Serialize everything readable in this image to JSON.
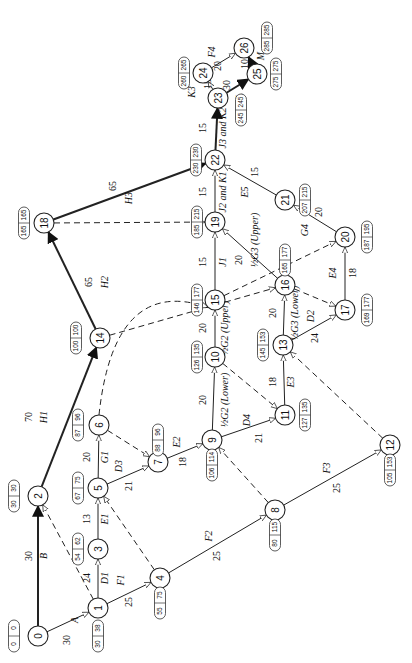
{
  "diagram": {
    "type": "activity-on-arrow network (CPM)",
    "orientation": "rotated 90deg counter-clockwise",
    "nodes": [
      {
        "id": "0",
        "x": 38,
        "y": 636,
        "es": "0",
        "lf": "0",
        "bx": 14,
        "by": 636
      },
      {
        "id": "1",
        "x": 98,
        "y": 608,
        "es": "30",
        "lf": "38",
        "bx": 98,
        "by": 636
      },
      {
        "id": "2",
        "x": 38,
        "y": 496,
        "es": "30",
        "lf": "30",
        "bx": 14,
        "by": 496
      },
      {
        "id": "3",
        "x": 98,
        "y": 549,
        "es": "54",
        "lf": "62",
        "bx": 78,
        "by": 549
      },
      {
        "id": "4",
        "x": 160,
        "y": 578,
        "es": "55",
        "lf": "75",
        "bx": 160,
        "by": 603
      },
      {
        "id": "5",
        "x": 98,
        "y": 488,
        "es": "67",
        "lf": "75",
        "bx": 78,
        "by": 488
      },
      {
        "id": "6",
        "x": 99,
        "y": 425,
        "es": "87",
        "lf": "96",
        "bx": 78,
        "by": 425
      },
      {
        "id": "7",
        "x": 158,
        "y": 462,
        "es": "88",
        "lf": "96",
        "bx": 158,
        "by": 440
      },
      {
        "id": "8",
        "x": 275,
        "y": 510,
        "es": "80",
        "lf": "115",
        "bx": 275,
        "by": 535
      },
      {
        "id": "9",
        "x": 212,
        "y": 440,
        "es": "106",
        "lf": "114",
        "bx": 212,
        "by": 465
      },
      {
        "id": "10",
        "x": 215,
        "y": 357,
        "es": "126",
        "lf": "135",
        "bx": 197,
        "by": 357
      },
      {
        "id": "11",
        "x": 285,
        "y": 415,
        "es": "127",
        "lf": "135",
        "bx": 305,
        "by": 415
      },
      {
        "id": "12",
        "x": 390,
        "y": 445,
        "es": "105",
        "lf": "153",
        "bx": 390,
        "by": 470
      },
      {
        "id": "13",
        "x": 283,
        "y": 345,
        "es": "145",
        "lf": "153",
        "bx": 263,
        "by": 345
      },
      {
        "id": "14",
        "x": 100,
        "y": 338,
        "es": "100",
        "lf": "100",
        "bx": 76,
        "by": 338
      },
      {
        "id": "15",
        "x": 215,
        "y": 300,
        "es": "146",
        "lf": "177",
        "bx": 197,
        "by": 300
      },
      {
        "id": "16",
        "x": 285,
        "y": 285,
        "es": "165",
        "lf": "177",
        "bx": 285,
        "by": 260
      },
      {
        "id": "17",
        "x": 345,
        "y": 310,
        "es": "169",
        "lf": "177",
        "bx": 367,
        "by": 310
      },
      {
        "id": "18",
        "x": 44,
        "y": 223,
        "es": "165",
        "lf": "165",
        "bx": 24,
        "by": 223
      },
      {
        "id": "19",
        "x": 215,
        "y": 222,
        "es": "185",
        "lf": "215",
        "bx": 197,
        "by": 222
      },
      {
        "id": "20",
        "x": 345,
        "y": 237,
        "es": "187",
        "lf": "195",
        "bx": 367,
        "by": 237
      },
      {
        "id": "21",
        "x": 285,
        "y": 200,
        "es": "207",
        "lf": "215",
        "bx": 305,
        "by": 200
      },
      {
        "id": "22",
        "x": 215,
        "y": 160,
        "es": "230",
        "lf": "230",
        "bx": 196,
        "by": 160
      },
      {
        "id": "23",
        "x": 218,
        "y": 98,
        "es": "245",
        "lf": "245",
        "bx": 241,
        "by": 110
      },
      {
        "id": "24",
        "x": 203,
        "y": 73,
        "es": "260",
        "lf": "265",
        "bx": 184,
        "by": 73
      },
      {
        "id": "25",
        "x": 257,
        "y": 74,
        "es": "275",
        "lf": "275",
        "bx": 276,
        "by": 74
      },
      {
        "id": "26",
        "x": 244,
        "y": 48,
        "es": "285",
        "lf": "285",
        "bx": 267,
        "by": 38
      }
    ],
    "edges": [
      {
        "from": "0",
        "to": "1",
        "name": "A",
        "dur": "30",
        "kind": "normal",
        "nx": 78,
        "ny": 620,
        "dx": 70,
        "dy": 640
      },
      {
        "from": "0",
        "to": "2",
        "name": "B",
        "dur": "30",
        "kind": "critical",
        "nx": 47,
        "ny": 556,
        "dx": 32,
        "dy": 556
      },
      {
        "from": "1",
        "to": "2",
        "name": "",
        "dur": "",
        "kind": "dummy"
      },
      {
        "from": "1",
        "to": "3",
        "name": "D1",
        "dur": "24",
        "kind": "normal",
        "nx": 108,
        "ny": 578,
        "dx": 90,
        "dy": 578
      },
      {
        "from": "1",
        "to": "4",
        "name": "F1",
        "dur": "25",
        "kind": "normal",
        "nx": 124,
        "ny": 580,
        "dx": 132,
        "dy": 602
      },
      {
        "from": "3",
        "to": "5",
        "name": "E1",
        "dur": "13",
        "kind": "normal",
        "nx": 108,
        "ny": 519,
        "dx": 90,
        "dy": 519
      },
      {
        "from": "4",
        "to": "5",
        "name": "",
        "dur": "",
        "kind": "dummy"
      },
      {
        "from": "2",
        "to": "14",
        "name": "H1",
        "dur": "70",
        "kind": "critical",
        "nx": 47,
        "ny": 417,
        "dx": 32,
        "dy": 417
      },
      {
        "from": "5",
        "to": "6",
        "name": "G1",
        "dur": "20",
        "kind": "normal",
        "nx": 108,
        "ny": 457,
        "dx": 90,
        "dy": 457
      },
      {
        "from": "5",
        "to": "7",
        "name": "D3",
        "dur": "21",
        "kind": "normal",
        "nx": 122,
        "ny": 466,
        "dx": 132,
        "dy": 486
      },
      {
        "from": "6",
        "to": "7",
        "name": "",
        "dur": "",
        "kind": "dummy"
      },
      {
        "from": "4",
        "to": "8",
        "name": "F2",
        "dur": "25",
        "kind": "normal",
        "nx": 212,
        "ny": 536,
        "dx": 220,
        "dy": 556
      },
      {
        "from": "7",
        "to": "9",
        "name": "E2",
        "dur": "18",
        "kind": "normal",
        "nx": 180,
        "ny": 442,
        "dx": 186,
        "dy": 462
      },
      {
        "from": "8",
        "to": "9",
        "name": "",
        "dur": "",
        "kind": "dummy"
      },
      {
        "from": "8",
        "to": "12",
        "name": "F3",
        "dur": "25",
        "kind": "normal",
        "nx": 330,
        "ny": 468,
        "dx": 340,
        "dy": 488
      },
      {
        "from": "9",
        "to": "10",
        "name": "½G2 (Lower)",
        "dur": "20",
        "kind": "normal",
        "nx": 228,
        "ny": 400,
        "dx": 206,
        "dy": 400
      },
      {
        "from": "9",
        "to": "11",
        "name": "D4",
        "dur": "21",
        "kind": "normal",
        "nx": 250,
        "ny": 420,
        "dx": 262,
        "dy": 438
      },
      {
        "from": "10",
        "to": "11",
        "name": "",
        "dur": "",
        "kind": "dummy"
      },
      {
        "from": "11",
        "to": "13",
        "name": "E3",
        "dur": "18",
        "kind": "normal",
        "nx": 294,
        "ny": 382,
        "dx": 276,
        "dy": 382
      },
      {
        "from": "12",
        "to": "13",
        "name": "",
        "dur": "",
        "kind": "dummy"
      },
      {
        "from": "10",
        "to": "15",
        "name": "½G2 (Upper)",
        "dur": "20",
        "kind": "normal",
        "nx": 228,
        "ny": 328,
        "dx": 206,
        "dy": 328
      },
      {
        "from": "6",
        "to": "15",
        "name": "",
        "dur": "",
        "kind": "dummy-curve"
      },
      {
        "from": "14",
        "to": "16",
        "name": "",
        "dur": "",
        "kind": "dummy"
      },
      {
        "from": "14",
        "to": "18",
        "name": "H2",
        "dur": "65",
        "kind": "critical",
        "nx": 108,
        "ny": 282,
        "dx": 92,
        "dy": 282
      },
      {
        "from": "13",
        "to": "16",
        "name": "½G3 (Lower)",
        "dur": "20",
        "kind": "normal",
        "nx": 298,
        "ny": 313,
        "dx": 276,
        "dy": 313
      },
      {
        "from": "13",
        "to": "17",
        "name": "D2",
        "dur": "24",
        "kind": "normal",
        "nx": 314,
        "ny": 316,
        "dx": 318,
        "dy": 338
      },
      {
        "from": "15",
        "to": "19",
        "name": "J1",
        "dur": "15",
        "kind": "normal",
        "nx": 226,
        "ny": 262,
        "dx": 206,
        "dy": 262
      },
      {
        "from": "15",
        "to": "20",
        "name": "",
        "dur": "",
        "kind": "dummy"
      },
      {
        "from": "16",
        "to": "17",
        "name": "",
        "dur": "",
        "kind": "dummy"
      },
      {
        "from": "16",
        "to": "19",
        "name": "½G3 (Upper)",
        "dur": "20",
        "kind": "normal",
        "nx": 258,
        "ny": 240,
        "dx": 242,
        "dy": 260
      },
      {
        "from": "17",
        "to": "20",
        "name": "E4",
        "dur": "18",
        "kind": "normal",
        "nx": 336,
        "ny": 273,
        "dx": 356,
        "dy": 273
      },
      {
        "from": "18",
        "to": "19",
        "name": "",
        "dur": "",
        "kind": "dummy"
      },
      {
        "from": "18",
        "to": "22",
        "name": "H3",
        "dur": "65",
        "kind": "critical",
        "nx": 132,
        "ny": 198,
        "dx": 116,
        "dy": 186
      },
      {
        "from": "19",
        "to": "22",
        "name": "J2 and K1",
        "dur": "15",
        "kind": "normal",
        "nx": 226,
        "ny": 192,
        "dx": 206,
        "dy": 192
      },
      {
        "from": "20",
        "to": "21",
        "name": "G4",
        "dur": "20",
        "kind": "normal",
        "nx": 308,
        "ny": 230,
        "dx": 322,
        "dy": 212
      },
      {
        "from": "21",
        "to": "22",
        "name": "E5",
        "dur": "15",
        "kind": "normal",
        "nx": 248,
        "ny": 192,
        "dx": 258,
        "dy": 172
      },
      {
        "from": "22",
        "to": "23",
        "name": "J3 and K2",
        "dur": "15",
        "kind": "critical",
        "nx": 226,
        "ny": 128,
        "dx": 206,
        "dy": 128
      },
      {
        "from": "23",
        "to": "24",
        "name": "K3",
        "dur": "15",
        "kind": "normal",
        "nx": 195,
        "ny": 92,
        "dx": 211,
        "dy": 84
      },
      {
        "from": "24",
        "to": "26",
        "name": "F4",
        "dur": "20",
        "kind": "normal",
        "nx": 215,
        "ny": 52,
        "dx": 221,
        "dy": 66
      },
      {
        "from": "23",
        "to": "25",
        "name": "L",
        "dur": "30",
        "kind": "critical",
        "nx": 243,
        "ny": 96,
        "dx": 230,
        "dy": 85
      },
      {
        "from": "25",
        "to": "26",
        "name": "M",
        "dur": "10",
        "kind": "critical",
        "nx": 264,
        "ny": 56,
        "dx": 248,
        "dy": 64
      }
    ]
  }
}
